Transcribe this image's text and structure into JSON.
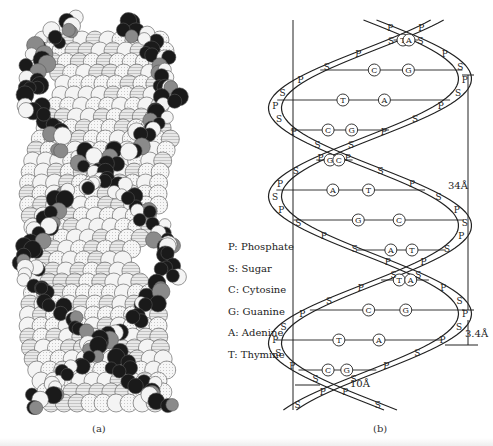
{
  "figure": {
    "panels": [
      {
        "id": "a",
        "caption": "(a)",
        "description": "space-filling molecular model of DNA double helix"
      },
      {
        "id": "b",
        "caption": "(b)",
        "description": "schematic of DNA double helix with labeled bases"
      }
    ],
    "legend": [
      {
        "key": "P",
        "label": "P: Phosphate"
      },
      {
        "key": "S",
        "label": "S: Sugar"
      },
      {
        "key": "C",
        "label": "C: Cytosine"
      },
      {
        "key": "G",
        "label": "G: Guanine"
      },
      {
        "key": "A",
        "label": "A: Adenine"
      },
      {
        "key": "T",
        "label": "T: Thymine"
      }
    ],
    "dimensions": {
      "pitch": "34Å",
      "base_spacing": "3.4Å",
      "diameter": "10Å"
    },
    "base_pairs_top_to_bottom": [
      [
        "T",
        "A"
      ],
      [
        "C",
        "G"
      ],
      [
        "T",
        "A"
      ],
      [
        "C",
        "G"
      ],
      [
        "G",
        "C"
      ],
      [
        "A",
        "T"
      ],
      [
        "G",
        "C"
      ],
      [
        "A",
        "T"
      ],
      [
        "T",
        "A"
      ],
      [
        "C",
        "G"
      ],
      [
        "T",
        "A"
      ],
      [
        "C",
        "G"
      ]
    ],
    "strand_unit_labels": [
      "P",
      "S"
    ],
    "colors": {
      "ink": "#222222",
      "atom_dark": "#1a1a1a",
      "atom_grey": "#8a8a8a",
      "atom_light": "#f4f4f4",
      "background": "#ffffff"
    }
  }
}
